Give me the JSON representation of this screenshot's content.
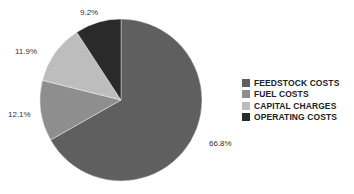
{
  "chart_data": {
    "type": "pie",
    "title": "",
    "categories": [
      "FEEDSTOCK COSTS",
      "FUEL COSTS",
      "CAPITAL CHARGES",
      "OPERATING COSTS"
    ],
    "values": [
      66.8,
      12.1,
      11.9,
      9.2
    ],
    "labels": [
      "66.8%",
      "12.1%",
      "11.9%",
      "9.2%"
    ],
    "colors": [
      "#5f5f5f",
      "#8e8e8e",
      "#bdbdbd",
      "#2a2a2a"
    ],
    "start_angle": "12 o'clock, clockwise",
    "legend_position": "right"
  },
  "legend": {
    "items": [
      {
        "label": "FEEDSTOCK COSTS",
        "color": "#5f5f5f"
      },
      {
        "label": "FUEL COSTS",
        "color": "#8e8e8e"
      },
      {
        "label": "CAPITAL CHARGES",
        "color": "#bdbdbd"
      },
      {
        "label": "OPERATING COSTS",
        "color": "#2a2a2a"
      }
    ]
  }
}
